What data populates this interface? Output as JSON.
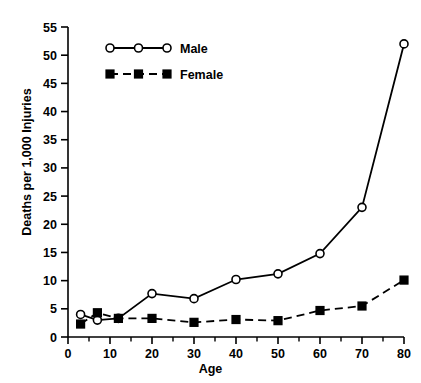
{
  "chart_data": {
    "type": "line",
    "title": "",
    "xlabel": "Age",
    "ylabel": "Deaths per 1,000 Injuries",
    "xlim": [
      0,
      80
    ],
    "ylim": [
      0,
      55
    ],
    "xticks": [
      0,
      10,
      20,
      30,
      40,
      50,
      60,
      70,
      80
    ],
    "xtick_labels": [
      "0",
      "10",
      "20",
      "30",
      "40",
      "50",
      "60",
      "70",
      "80"
    ],
    "xminor_ticks": [
      5,
      15,
      25,
      35,
      45,
      55,
      65,
      75
    ],
    "yticks": [
      0,
      5,
      10,
      15,
      20,
      25,
      30,
      35,
      40,
      45,
      50,
      55
    ],
    "ytick_labels": [
      "0",
      "5",
      "10",
      "15",
      "20",
      "25",
      "30",
      "35",
      "40",
      "45",
      "50",
      "55"
    ],
    "grid": false,
    "legend_position": "upper-left",
    "series": [
      {
        "name": "Male",
        "marker": "open-circle",
        "line_style": "solid",
        "color": "#000000",
        "x": [
          3,
          7,
          12,
          20,
          30,
          40,
          50,
          60,
          70,
          80
        ],
        "values": [
          4.0,
          3.0,
          3.3,
          7.7,
          6.8,
          10.2,
          11.2,
          14.8,
          23.0,
          52.0
        ]
      },
      {
        "name": "Female",
        "marker": "filled-square",
        "line_style": "dashed",
        "color": "#000000",
        "x": [
          3,
          7,
          12,
          20,
          30,
          40,
          50,
          60,
          70,
          80
        ],
        "values": [
          2.3,
          4.3,
          3.3,
          3.3,
          2.6,
          3.1,
          2.9,
          4.7,
          5.5,
          10.1
        ]
      }
    ]
  },
  "legend": {
    "items": [
      {
        "label": "Male"
      },
      {
        "label": "Female"
      }
    ]
  }
}
